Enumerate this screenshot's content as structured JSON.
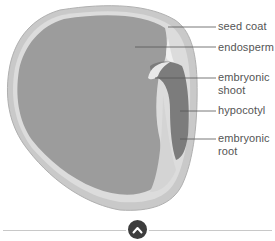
{
  "diagram": {
    "labels": [
      {
        "id": "seed-coat",
        "text": "seed coat",
        "top": 20
      },
      {
        "id": "endosperm",
        "text": "endosperm",
        "top": 41
      },
      {
        "id": "embryonic-shoot",
        "text": "embryonic\nshoot",
        "top": 71
      },
      {
        "id": "hypocotyl",
        "text": "hypocotyl",
        "top": 104
      },
      {
        "id": "embryonic-root",
        "text": "embryonic\nroot",
        "top": 132
      }
    ],
    "colors": {
      "endosperm": "#9a9a9a",
      "seed_coat": "#c4c4c4",
      "embryo": "#7a7a7a",
      "leader_line": "#555555",
      "label_text": "#555555"
    }
  },
  "controls": {
    "collapse_button_icon": "chevron-up-icon",
    "collapse_button_color": "#3d3d3d"
  }
}
